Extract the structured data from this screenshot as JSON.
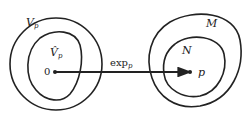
{
  "diagram": {
    "type": "exponential-map",
    "left": {
      "outer_label": "V",
      "outer_sub": "p",
      "inner_label": "V̂",
      "inner_sub": "p",
      "origin_label": "0"
    },
    "arrow": {
      "label": "exp",
      "sub": "p"
    },
    "right": {
      "outer_label": "M",
      "inner_label": "N",
      "point_label": "p"
    },
    "colors": {
      "stroke": "#222222",
      "background": "#ffffff"
    }
  }
}
